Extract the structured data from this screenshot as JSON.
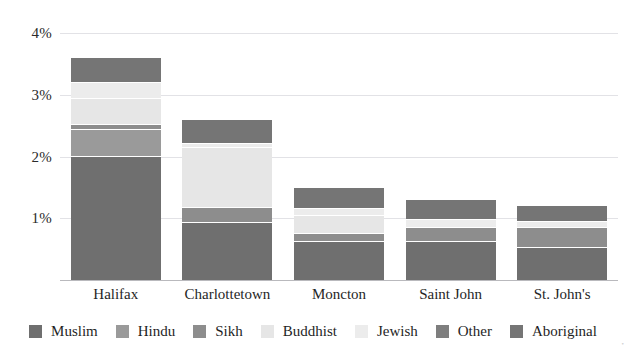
{
  "chart_data": {
    "type": "bar",
    "subtype": "stacked-bar",
    "title": "",
    "xlabel": "",
    "ylabel": "",
    "ylim": [
      0,
      4.2
    ],
    "yticks": [
      1,
      2,
      3,
      4
    ],
    "ytick_labels": [
      "1%",
      "2%",
      "3%",
      "4%"
    ],
    "grid": true,
    "legend_position": "bottom",
    "units": "percent",
    "categories": [
      "Halifax",
      "Charlottetown",
      "Moncton",
      "Saint John",
      "St. John's"
    ],
    "series": [
      {
        "name": "Muslim",
        "color": "#6f6f6f",
        "values": [
          2.0,
          0.92,
          0.62,
          0.62,
          0.52
        ]
      },
      {
        "name": "Hindu",
        "color": "#9a9a9a",
        "values": [
          0.43,
          0.0,
          0.0,
          0.0,
          0.0
        ]
      },
      {
        "name": "Sikh",
        "color": "#8d8d8d",
        "values": [
          0.09,
          0.25,
          0.12,
          0.23,
          0.32
        ]
      },
      {
        "name": "Buddhist",
        "color": "#e6e6e6",
        "values": [
          0.42,
          0.97,
          0.3,
          0.0,
          0.0
        ]
      },
      {
        "name": "Jewish",
        "color": "#ececec",
        "values": [
          0.25,
          0.06,
          0.11,
          0.12,
          0.1
        ]
      },
      {
        "name": "Other",
        "color": "#7e7e7e",
        "values": [
          0.0,
          0.0,
          0.0,
          0.0,
          0.0
        ]
      },
      {
        "name": "Aboriginal",
        "color": "#757575",
        "values": [
          0.41,
          0.4,
          0.35,
          0.33,
          0.26
        ]
      }
    ],
    "totals": [
      3.6,
      2.6,
      1.5,
      1.3,
      1.2
    ]
  },
  "axis": {
    "y_tick_labels": [
      "4%",
      "3%",
      "2%",
      "1%"
    ],
    "x_tick_labels": [
      "Halifax",
      "Charlottetown",
      "Moncton",
      "Saint John",
      "St. John's"
    ]
  },
  "legend": {
    "items": [
      {
        "label": "Muslim",
        "color": "#6f6f6f"
      },
      {
        "label": "Hindu",
        "color": "#9a9a9a"
      },
      {
        "label": "Sikh",
        "color": "#8d8d8d"
      },
      {
        "label": "Buddhist",
        "color": "#e6e6e6"
      },
      {
        "label": "Jewish",
        "color": "#ececec"
      },
      {
        "label": "Other",
        "color": "#7e7e7e"
      },
      {
        "label": "Aboriginal",
        "color": "#757575"
      }
    ]
  },
  "clipped_title": ""
}
